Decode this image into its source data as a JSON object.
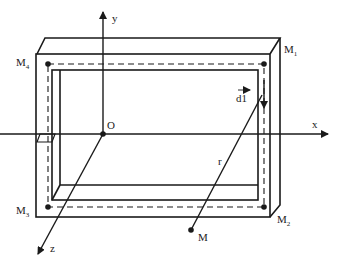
{
  "diagram": {
    "type": "rectangular current loop in 3D frame",
    "axes": {
      "x": {
        "label": "x"
      },
      "y": {
        "label": "y"
      },
      "z": {
        "label": "z"
      },
      "origin": {
        "label": "O"
      }
    },
    "corners": [
      {
        "id": "M1",
        "label": "M",
        "sub": "1"
      },
      {
        "id": "M2",
        "label": "M",
        "sub": "2"
      },
      {
        "id": "M3",
        "label": "M",
        "sub": "3"
      },
      {
        "id": "M4",
        "label": "M",
        "sub": "4"
      }
    ],
    "point": {
      "label": "M"
    },
    "vector": {
      "label": "dl",
      "display": "d1"
    },
    "distance": {
      "label": "r"
    },
    "colors": {
      "stroke": "#1a1a1a",
      "background": "#ffffff"
    }
  }
}
